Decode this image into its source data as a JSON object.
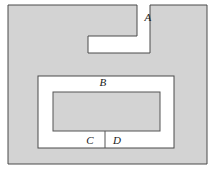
{
  "figure": {
    "kind": "geometry-diagram",
    "canvas": {
      "width": 216,
      "height": 172
    },
    "colors": {
      "background": "#ffffff",
      "shaded_fill": "#d3d3d3",
      "hatch_fill": "#d3d3d3",
      "stroke": "#4a4a4a",
      "inner_stroke": "#555555",
      "label_color": "#1a1a1a"
    },
    "outer_region": {
      "name": "outer-shaded-region",
      "x": 8,
      "y": 5,
      "width": 199,
      "height": 159
    },
    "notch": {
      "name": "z-shaped-notch",
      "description": "white step-shaped cut entering from the top edge",
      "points": "137,5 137,36 88,36 88,53 150,53 150,5"
    },
    "channel": {
      "name": "inner-u-channel",
      "x": 38,
      "y": 76,
      "width": 136,
      "height": 72
    },
    "inner_block": {
      "name": "inner-shaded-block",
      "x": 53,
      "y": 92,
      "width": 107,
      "height": 39
    },
    "divider": {
      "name": "cd-divider-line",
      "x": 105,
      "y1": 131,
      "y2": 148
    },
    "labels": [
      {
        "id": "label-a",
        "text": "A",
        "x": 148,
        "y": 17
      },
      {
        "id": "label-b",
        "text": "B",
        "x": 103,
        "y": 82
      },
      {
        "id": "label-c",
        "text": "C",
        "x": 90,
        "y": 140
      },
      {
        "id": "label-d",
        "text": "D",
        "x": 117,
        "y": 140
      }
    ]
  }
}
